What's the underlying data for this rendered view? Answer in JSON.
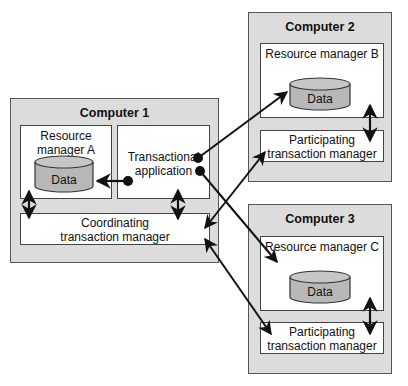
{
  "computers": [
    {
      "title": "Computer 1",
      "resource_manager": "Resource manager A",
      "resource_manager_lines": [
        "Resource",
        "manager A"
      ],
      "data_label": "Data",
      "app_lines": [
        "Transactional",
        "application"
      ],
      "tm_lines": [
        "Coordinating",
        "transaction manager"
      ]
    },
    {
      "title": "Computer 2",
      "resource_manager": "Resource manager B",
      "data_label": "Data",
      "tm_lines": [
        "Participating",
        "transaction manager"
      ]
    },
    {
      "title": "Computer 3",
      "resource_manager": "Resource manager C",
      "data_label": "Data",
      "tm_lines": [
        "Participating",
        "transaction manager"
      ]
    }
  ],
  "colors": {
    "computer_fill": "#dcdcdc",
    "box_fill": "#ffffff",
    "cylinder_fill": "#b8b8b8",
    "line": "#111111"
  }
}
